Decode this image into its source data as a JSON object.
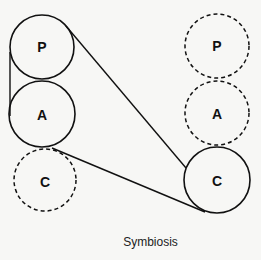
{
  "diagram": {
    "caption": "Symbiosis",
    "left_column": {
      "circles": [
        {
          "label": "P",
          "style": "solid"
        },
        {
          "label": "A",
          "style": "solid"
        },
        {
          "label": "C",
          "style": "dashed"
        }
      ]
    },
    "right_column": {
      "circles": [
        {
          "label": "P",
          "style": "dashed"
        },
        {
          "label": "A",
          "style": "dashed"
        },
        {
          "label": "C",
          "style": "solid"
        }
      ]
    },
    "colors": {
      "stroke": "#111111",
      "background": "#f7f7f5"
    }
  }
}
